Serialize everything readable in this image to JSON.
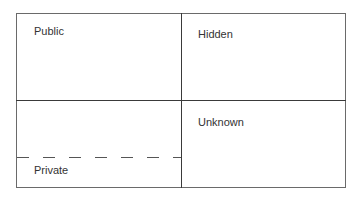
{
  "diagram": {
    "type": "johari-window",
    "quadrants": [
      {
        "id": "public",
        "label": "Public"
      },
      {
        "id": "hidden",
        "label": "Hidden"
      },
      {
        "id": "private",
        "label": "Private"
      },
      {
        "id": "unknown",
        "label": "Unknown"
      }
    ],
    "colors": {
      "border": "#6a6a6a",
      "divider": "#3a3a3a",
      "text": "#333333"
    }
  }
}
